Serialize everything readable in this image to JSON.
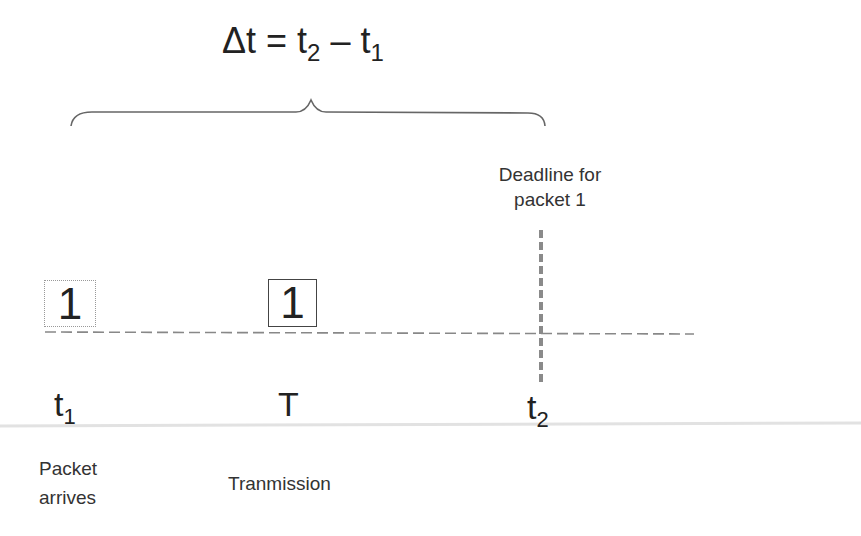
{
  "formula": {
    "lhs": "Δt",
    "equals": " = ",
    "t2_base": "t",
    "t2_sub": "2",
    "minus": " – ",
    "t1_base": "t",
    "t1_sub": "1"
  },
  "deadline_label": {
    "line1": "Deadline for",
    "line2": "packet 1"
  },
  "packets": {
    "waiting": "1",
    "transmitting": "1"
  },
  "time_labels": {
    "t1_base": "t",
    "t1_sub": "1",
    "T": "T",
    "t2_base": "t",
    "t2_sub": "2"
  },
  "descriptions": {
    "arrives_line1": "Packet",
    "arrives_line2": "arrives",
    "transmission": "Tranmission"
  },
  "colors": {
    "text": "#222222",
    "dashed_line": "#888888",
    "deadline_line": "#8a8a8a",
    "brace": "#666666",
    "separator": "#e4e4e4"
  }
}
